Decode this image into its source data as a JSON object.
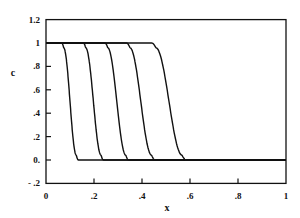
{
  "chart_data": {
    "type": "line",
    "title": "",
    "xlabel": "x",
    "ylabel": "c",
    "xlim": [
      0,
      1
    ],
    "ylim": [
      -0.2,
      1.2
    ],
    "grid": false,
    "legend": null,
    "x_ticks": [
      {
        "value": 0,
        "label": "0"
      },
      {
        "value": 0.2,
        "label": ".2"
      },
      {
        "value": 0.4,
        "label": ".4"
      },
      {
        "value": 0.6,
        "label": ".6"
      },
      {
        "value": 0.8,
        "label": ".8"
      },
      {
        "value": 1,
        "label": "1"
      }
    ],
    "y_ticks": [
      {
        "value": 1.2,
        "label": "1.2"
      },
      {
        "value": 1,
        "label": "1"
      },
      {
        "value": 0.8,
        "label": ".8"
      },
      {
        "value": 0.6,
        "label": ".6"
      },
      {
        "value": 0.4,
        "label": ".4"
      },
      {
        "value": 0.2,
        "label": ".2"
      },
      {
        "value": 0,
        "label": "0."
      },
      {
        "value": -0.2,
        "label": "- .2"
      }
    ],
    "series": [
      {
        "name": "front 1",
        "start": 0.065,
        "end": 0.135
      },
      {
        "name": "front 2",
        "start": 0.155,
        "end": 0.24
      },
      {
        "name": "front 3",
        "start": 0.245,
        "end": 0.345
      },
      {
        "name": "front 4",
        "start": 0.335,
        "end": 0.455
      },
      {
        "name": "front 5",
        "start": 0.44,
        "end": 0.585
      }
    ],
    "series_description": "Step profiles c(x): c=1 for x < start, smooth drop to c=0 by end, c=0 afterwards. Midpoints approx 0.10, 0.20, 0.30, 0.40, 0.51."
  }
}
